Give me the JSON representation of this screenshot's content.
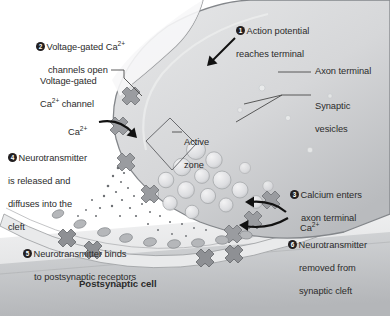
{
  "colors": {
    "background": "#ffffff",
    "text": "#2b2b2b",
    "badge_fill": "#231f20",
    "badge_text": "#ffffff",
    "terminal_fill": "#d9dadb",
    "terminal_edge": "#8f9194",
    "vesicle_fill": "#e3e4e5",
    "vesicle_edge": "#a9abae",
    "channel_fill": "#9a9ca0",
    "channel_edge": "#6e7175",
    "postsynaptic_fill": "#c9cbcd",
    "cleft_fill": "#f0f0f1",
    "leader_line": "#4a4a4a",
    "arrow": "#111111"
  },
  "steps": [
    {
      "number": "1",
      "label": "Action potential\nreaches terminal"
    },
    {
      "number": "2",
      "label": "Voltage-gated Ca2+\nchannels open"
    },
    {
      "number": "3",
      "label": "Calcium enters\naxon terminal"
    },
    {
      "number": "4",
      "label": "Neurotransmitter\nis released and\ndiffuses into the\ncleft"
    },
    {
      "number": "5",
      "label": "Neurotransmitter binds\nto postsynaptic receptors"
    },
    {
      "number": "6",
      "label": "Neurotransmitter\nremoved from\nsynaptic cleft"
    }
  ],
  "step_text": {
    "s1_line1": "Action potential",
    "s1_line2": "reaches terminal",
    "s2_pre": "Voltage-gated Ca",
    "s2_sup": "2+",
    "s2_line2": "channels open",
    "s3_line1": "Calcium enters",
    "s3_line2": "axon terminal",
    "s4_line1": "Neurotransmitter",
    "s4_line2": "is released and",
    "s4_line3": "diffuses into the",
    "s4_line4": "cleft",
    "s5_line1": "Neurotransmitter binds",
    "s5_line2": "to postsynaptic receptors",
    "s6_line1": "Neurotransmitter",
    "s6_line2": "removed from",
    "s6_line3": "synaptic cleft"
  },
  "parts": {
    "voltage_gated_channel_line1": "Voltage-gated",
    "voltage_gated_channel_line2_pre": "Ca",
    "voltage_gated_channel_line2_sup": "2+",
    "voltage_gated_channel_line2_post": " channel",
    "axon_terminal": "Axon terminal",
    "synaptic_vesicles_line1": "Synaptic",
    "synaptic_vesicles_line2": "vesicles",
    "active_zone_line1": "Active",
    "active_zone_line2": "zone",
    "postsynaptic_cell": "Postsynaptic cell"
  },
  "ions": {
    "calcium_left_pre": "Ca",
    "calcium_left_sup": "2+",
    "calcium_right_pre": "Ca",
    "calcium_right_sup": "2+"
  }
}
